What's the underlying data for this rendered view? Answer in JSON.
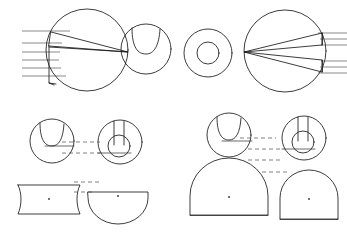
{
  "drawing": {
    "title": "Orthographic Projection Sheet",
    "background_color": "#ffffff",
    "line_color": "#1a1a1a",
    "ray_color": "#3a3a3a",
    "projection_color": "#4a4a4a",
    "canvas": {
      "width": 347,
      "height": 235
    },
    "groups": [
      {
        "id": "top-left-group",
        "label": "Top Left Sectional View",
        "figures": [
          {
            "id": "tl-main-circle",
            "name": "large-circle-with-wedge",
            "type": "circle",
            "cx": 87,
            "cy": 50,
            "r": 41,
            "notes": "Large circle with inscribed wedge and vertical web"
          },
          {
            "id": "tl-wedge-upper",
            "name": "upper-wedge",
            "type": "polygon",
            "points": "49,35 128,52 52,31"
          },
          {
            "id": "tl-wedge-lower",
            "name": "lower-wedge",
            "type": "polygon",
            "points": "49,46 128,52 49,53"
          },
          {
            "id": "tl-web",
            "name": "vertical-web",
            "type": "polyline",
            "points": "49,46 49,82 52,84"
          },
          {
            "id": "tl-rays",
            "name": "horizontal-ray-lines",
            "type": "lines",
            "count": 6,
            "x_start": 22,
            "x_end": 78,
            "y_values": [
              31,
              43,
              52,
              60,
              68,
              76
            ]
          }
        ]
      },
      {
        "id": "top-mid-left-group",
        "label": "Notched Disc View",
        "figures": [
          {
            "id": "tml-circle",
            "name": "circle-with-top-notch",
            "type": "circle",
            "cx": 146,
            "cy": 49,
            "r": 25
          },
          {
            "id": "tml-notch",
            "name": "u-notch",
            "type": "path",
            "description": "U shaped notch cut into top of disc"
          }
        ]
      },
      {
        "id": "top-mid-right-group",
        "label": "Annulus View",
        "figures": [
          {
            "id": "tmr-outer",
            "name": "annulus-outer-circle",
            "type": "circle",
            "cx": 208,
            "cy": 53,
            "r": 24
          },
          {
            "id": "tmr-inner",
            "name": "annulus-inner-circle",
            "type": "circle",
            "cx": 208,
            "cy": 53,
            "r": 11
          }
        ]
      },
      {
        "id": "top-right-group",
        "label": "Top Right Sectional View (mirrored)",
        "figures": [
          {
            "id": "tr-main-circle",
            "name": "large-circle-with-wedge-mirrored",
            "type": "circle",
            "cx": 285,
            "cy": 51,
            "r": 41
          },
          {
            "id": "tr-wedge-upper",
            "name": "upper-wedge-mirrored",
            "type": "polygon",
            "points": "322,33 245,52 322,44"
          },
          {
            "id": "tr-wedge-lower",
            "name": "lower-wedge-mirrored",
            "type": "polygon",
            "points": "322,60 245,52 322,72"
          },
          {
            "id": "tr-rays-upper",
            "name": "horizontal-ray-lines-upper",
            "type": "lines",
            "count": 3,
            "x_start": 300,
            "x_end": 347,
            "y_values": [
              33,
              39,
              45
            ]
          },
          {
            "id": "tr-rays-lower",
            "name": "horizontal-ray-lines-lower",
            "type": "lines",
            "count": 3,
            "x_start": 300,
            "x_end": 347,
            "y_values": [
              61,
              67,
              73
            ]
          }
        ]
      },
      {
        "id": "bottom-left-group",
        "label": "Bottom Left Projection Set",
        "figures": [
          {
            "id": "bl-notched-circle",
            "name": "notched-circle-front-view",
            "type": "circle",
            "cx": 52,
            "cy": 141,
            "r": 22
          },
          {
            "id": "bl-keyhole-circle",
            "name": "keyhole-circle-plan-view",
            "type": "circle",
            "cx": 120,
            "cy": 142,
            "r": 22
          },
          {
            "id": "bl-keyhole-inner",
            "name": "keyhole-inner-bore",
            "type": "circle",
            "cx": 119,
            "cy": 146,
            "r": 11
          },
          {
            "id": "bl-barrel",
            "name": "barrel-side-view",
            "type": "shape",
            "cx": 51,
            "cy": 201
          },
          {
            "id": "bl-semicircle",
            "name": "semicircle-section-view",
            "type": "shape",
            "cx": 117,
            "cy": 197
          },
          {
            "id": "bl-projection-lines",
            "name": "projection-dashed-lines",
            "type": "dashed-lines",
            "count": 4
          }
        ]
      },
      {
        "id": "bottom-right-group",
        "label": "Bottom Right Projection Set",
        "figures": [
          {
            "id": "br-notched-circle",
            "name": "notched-circle-front-view",
            "type": "circle",
            "cx": 229,
            "cy": 135,
            "r": 22
          },
          {
            "id": "br-keyhole-circle",
            "name": "keyhole-circle-plan-view",
            "type": "circle",
            "cx": 304,
            "cy": 138,
            "r": 22
          },
          {
            "id": "br-keyhole-inner",
            "name": "keyhole-inner-bore",
            "type": "circle",
            "cx": 303,
            "cy": 142,
            "r": 11
          },
          {
            "id": "br-dome-large",
            "name": "large-dome-side-view",
            "type": "shape",
            "cx": 229,
            "cy": 196
          },
          {
            "id": "br-dome-right",
            "name": "dome-section-view",
            "type": "shape",
            "cx": 309,
            "cy": 199
          },
          {
            "id": "br-projection-lines",
            "name": "projection-dashed-lines",
            "type": "dashed-lines",
            "count": 4
          }
        ]
      }
    ]
  }
}
